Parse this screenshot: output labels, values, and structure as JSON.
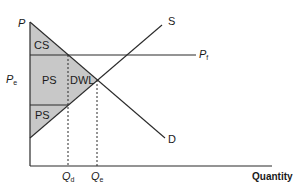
{
  "diagram": {
    "type": "supply-demand-price-floor",
    "axes": {
      "y_label": "P",
      "x_label": "Quantity"
    },
    "curves": {
      "supply_label": "S",
      "demand_label": "D"
    },
    "price_lines": {
      "floor_label": "P",
      "floor_sub": "f",
      "equilibrium_label": "P",
      "equilibrium_sub": "e"
    },
    "quantity_marks": {
      "qd_label": "Q",
      "qd_sub": "d",
      "qe_label": "Q",
      "qe_sub": "e"
    },
    "regions": {
      "consumer_surplus": "CS",
      "producer_surplus_upper": "PS",
      "deadweight_loss": "DWL",
      "producer_surplus_lower": "PS"
    },
    "colors": {
      "shade": "#c8c8c8",
      "line": "#2a2a2a",
      "background": "#ffffff"
    }
  }
}
